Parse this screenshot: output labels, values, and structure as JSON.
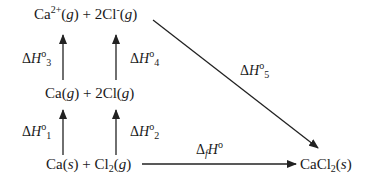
{
  "diagram": {
    "species": {
      "top": {
        "left_base": "Ca",
        "left_sup": "2+",
        "left_phase": "g",
        "mid": " + 2Cl",
        "right_sup": "-",
        "right_phase": "g"
      },
      "middle": {
        "a": "Ca(",
        "a_phase": "g",
        "b": ") + 2Cl(",
        "b_phase": "g",
        "c": ")"
      },
      "bottom": {
        "a": "Ca(",
        "a_phase": "s",
        "b": ") + Cl",
        "b_sub": "2",
        "c": "(",
        "c_phase": "g",
        "d": ")"
      },
      "product": {
        "a": "CaCl",
        "a_sub": "2",
        "b": "(",
        "b_phase": "s",
        "c": ")"
      }
    },
    "enthalpies": {
      "dH1": {
        "delta": "Δ",
        "H": "H",
        "deg": "o",
        "idx": "1"
      },
      "dH2": {
        "delta": "Δ",
        "H": "H",
        "deg": "o",
        "idx": "2"
      },
      "dH3": {
        "delta": "Δ",
        "H": "H",
        "deg": "o",
        "idx": "3"
      },
      "dH4": {
        "delta": "Δ",
        "H": "H",
        "deg": "o",
        "idx": "4"
      },
      "dH5": {
        "delta": "Δ",
        "H": "H",
        "deg": "o",
        "idx": "5"
      },
      "dHf": {
        "delta": "Δ",
        "f": "f",
        "H": "H",
        "deg": "o"
      }
    },
    "line_color": "#222222"
  }
}
